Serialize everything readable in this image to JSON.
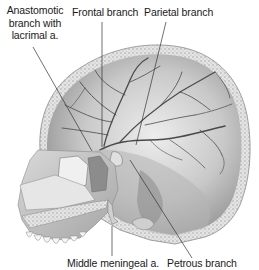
{
  "figure": {
    "labels": [
      {
        "id": "anastomotic",
        "text": "Anastomotic branch with lacrimal a.",
        "lines": [
          "Anastomotic",
          "branch with",
          "lacrimal a."
        ]
      },
      {
        "id": "frontal",
        "text": "Frontal branch"
      },
      {
        "id": "parietal",
        "text": "Parietal branch"
      },
      {
        "id": "middle_meningeal",
        "text": "Middle meningeal a."
      },
      {
        "id": "petrous",
        "text": "Petrous branch"
      }
    ],
    "colors": {
      "background": "#ffffff",
      "bone_light": "#e8e8e8",
      "bone_mid": "#bdbdbd",
      "bone_dark": "#6e6e6e",
      "vessel": "#4a4a4a",
      "text": "#1a1a1a",
      "leader_line": "#333333"
    }
  }
}
